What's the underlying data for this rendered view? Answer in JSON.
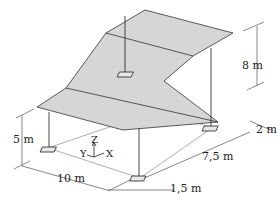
{
  "diagram": {
    "type": "3d-structure-drawing",
    "colors": {
      "surface": "#d6d6d6",
      "line": "#333333",
      "dimension_line": "#555555",
      "background": "#ffffff"
    },
    "dimensions": {
      "height_left": "5 m",
      "height_right": "8 m",
      "width_x": "10 m",
      "depth_1": "2 m",
      "depth_2": "7,5 m",
      "depth_3": "1,5 m"
    },
    "axes": {
      "x": "X",
      "y": "Y",
      "z": "Z"
    },
    "supports_count": 4
  }
}
